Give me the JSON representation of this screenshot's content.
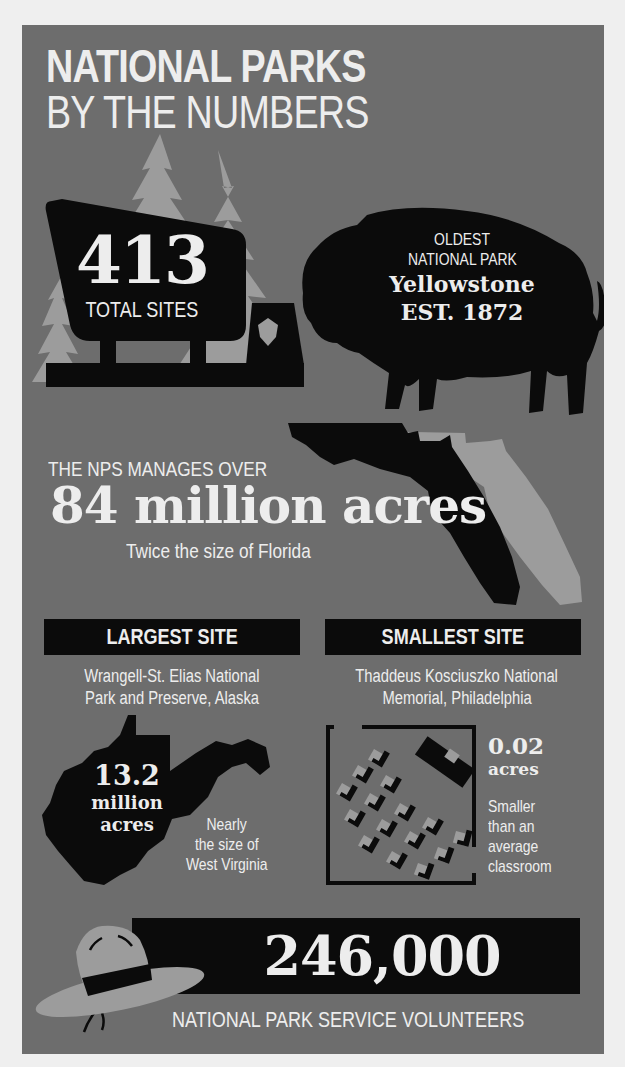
{
  "title": {
    "line1": "NATIONAL PARKS",
    "line2": "BY THE NUMBERS"
  },
  "total_sites": {
    "value": "413",
    "label": "TOTAL SITES",
    "icons": [
      "tree-icon",
      "park-sign-icon",
      "arrowhead-icon"
    ]
  },
  "oldest_park": {
    "line1": "OLDEST",
    "line2": "NATIONAL PARK",
    "name": "Yellowstone",
    "established": "EST. 1872",
    "icon": "bison-icon"
  },
  "acres": {
    "intro": "THE NPS MANAGES OVER",
    "value": "84 million acres",
    "comparison": "Twice the size of Florida",
    "icon": "florida-map-icon"
  },
  "largest_site": {
    "header": "LARGEST SITE",
    "name_line1": "Wrangell-St. Elias National",
    "name_line2": "Park and Preserve, Alaska",
    "value": "13.2",
    "unit_line1": "million",
    "unit_line2": "acres",
    "comparison_line1": "Nearly",
    "comparison_line2": "the size of",
    "comparison_line3": "West Virginia",
    "icon": "west-virginia-map-icon"
  },
  "smallest_site": {
    "header": "SMALLEST SITE",
    "name_line1": "Thaddeus Kosciuszko National",
    "name_line2": "Memorial, Philadelphia",
    "value": "0.02",
    "unit": "acres",
    "comparison_line1": "Smaller",
    "comparison_line2": "than an",
    "comparison_line3": "average",
    "comparison_line4": "classroom",
    "icon": "classroom-icon"
  },
  "volunteers": {
    "value": "246,000",
    "label": "NATIONAL PARK SERVICE VOLUNTEERS",
    "icon": "ranger-hat-icon"
  },
  "colors": {
    "panel": "#6d6d6d",
    "page": "#efefef",
    "dark": "#0b0b0b",
    "light_shape": "#9c9c9c",
    "text": "#ededed"
  }
}
